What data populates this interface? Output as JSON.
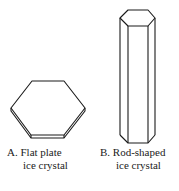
{
  "figures": [
    {
      "id": "A",
      "letter": "A.",
      "title_line1": "Flat plate",
      "title_line2": "ice crystal",
      "shape": "hexagonal-plate"
    },
    {
      "id": "B",
      "letter": "B.",
      "title_line1": "Rod-shaped",
      "title_line2": "ice crystal",
      "shape": "hexagonal-column"
    }
  ],
  "colors": {
    "stroke": "#1a1a1a",
    "background": "#ffffff"
  }
}
